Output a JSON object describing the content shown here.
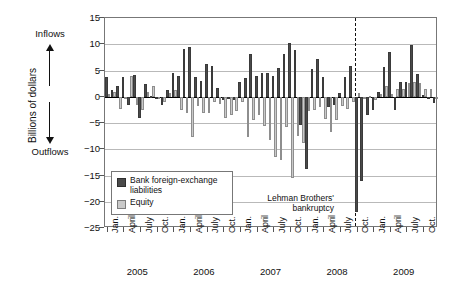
{
  "axis": {
    "y_title": "Billions of dollars",
    "y_ticks": [
      "15",
      "10",
      "5",
      "0",
      "-5",
      "-10",
      "-15",
      "-20",
      "-25"
    ],
    "quarter_labels": [
      "Jan.",
      "April",
      "July",
      "Oct."
    ],
    "year_labels": [
      "2005",
      "2006",
      "2007",
      "2008",
      "2009"
    ]
  },
  "annotations": {
    "inflows": "Inflows",
    "outflows": "Outflows",
    "event_line1": "Lehman Brothers'",
    "event_line2": "bankruptcy"
  },
  "legend": {
    "items": [
      {
        "label": "Bank foreign-exchange liabilities",
        "color": "#4a4a4a",
        "swatch": "dark"
      },
      {
        "label": "Equity",
        "color": "#c9c9c9",
        "swatch": "light"
      }
    ]
  },
  "chart_data": {
    "type": "bar",
    "title": "",
    "xlabel": "",
    "ylabel": "Billions of dollars",
    "ylim": [
      -25,
      15
    ],
    "ytick_step": 5,
    "grid": true,
    "legend_position": "inside-lower-left",
    "x": [
      "2005-01",
      "2005-02",
      "2005-03",
      "2005-04",
      "2005-05",
      "2005-06",
      "2005-07",
      "2005-08",
      "2005-09",
      "2005-10",
      "2005-11",
      "2005-12",
      "2006-01",
      "2006-02",
      "2006-03",
      "2006-04",
      "2006-05",
      "2006-06",
      "2006-07",
      "2006-08",
      "2006-09",
      "2006-10",
      "2006-11",
      "2006-12",
      "2007-01",
      "2007-02",
      "2007-03",
      "2007-04",
      "2007-05",
      "2007-06",
      "2007-07",
      "2007-08",
      "2007-09",
      "2007-10",
      "2007-11",
      "2007-12",
      "2008-01",
      "2008-02",
      "2008-03",
      "2008-04",
      "2008-05",
      "2008-06",
      "2008-07",
      "2008-08",
      "2008-09",
      "2008-10",
      "2008-11",
      "2008-12",
      "2009-01",
      "2009-02",
      "2009-03",
      "2009-04",
      "2009-05",
      "2009-06",
      "2009-07",
      "2009-08",
      "2009-09",
      "2009-10",
      "2009-11",
      "2009-12"
    ],
    "categories": [
      "Jan. 2005",
      "Feb. 2005",
      "Mar. 2005",
      "April 2005",
      "May 2005",
      "June 2005",
      "July 2005",
      "Aug. 2005",
      "Sept. 2005",
      "Oct. 2005",
      "Nov. 2005",
      "Dec. 2005",
      "Jan. 2006",
      "Feb. 2006",
      "Mar. 2006",
      "April 2006",
      "May 2006",
      "June 2006",
      "July 2006",
      "Aug. 2006",
      "Sept. 2006",
      "Oct. 2006",
      "Nov. 2006",
      "Dec. 2006",
      "Jan. 2007",
      "Feb. 2007",
      "Mar. 2007",
      "April 2007",
      "May 2007",
      "June 2007",
      "July 2007",
      "Aug. 2007",
      "Sept. 2007",
      "Oct. 2007",
      "Nov. 2007",
      "Dec. 2007",
      "Jan. 2008",
      "Feb. 2008",
      "Mar. 2008",
      "April 2008",
      "May 2008",
      "June 2008",
      "July 2008",
      "Aug. 2008",
      "Sept. 2008",
      "Oct. 2008",
      "Nov. 2008",
      "Dec. 2008",
      "Jan. 2009",
      "Feb. 2009",
      "Mar. 2009",
      "April 2009",
      "May 2009",
      "June 2009",
      "July 2009",
      "Aug. 2009",
      "Sept. 2009",
      "Oct. 2009",
      "Nov. 2009",
      "Dec. 2009"
    ],
    "series": [
      {
        "name": "Bank foreign-exchange liabilities",
        "color": "#4a4a4a",
        "values": [
          3.7,
          1.3,
          2.0,
          3.8,
          -1.6,
          4.1,
          -4.0,
          2.5,
          0.2,
          -0.4,
          -1.6,
          1.2,
          4.6,
          4.0,
          9.1,
          9.4,
          3.7,
          3.0,
          6.3,
          5.8,
          1.7,
          -0.6,
          -0.5,
          -0.7,
          2.9,
          3.6,
          8.2,
          4.0,
          4.6,
          4.5,
          3.9,
          5.4,
          8.2,
          10.3,
          9.0,
          -5.4,
          -13.8,
          5.3,
          7.2,
          3.8,
          -2.0,
          -1.5,
          0.7,
          3.8,
          5.8,
          -22.0,
          -16.0,
          -3.5,
          -2.5,
          1.0,
          5.7,
          8.5,
          -2.5,
          2.8,
          2.9,
          9.8,
          4.3,
          0.4,
          -0.3,
          -1.2
        ]
      },
      {
        "name": "Equity",
        "color": "#c9c9c9",
        "values": [
          0.5,
          0.9,
          -2.3,
          -0.3,
          4.0,
          -1.5,
          -2.5,
          0.9,
          2.0,
          -0.3,
          -1.0,
          0.7,
          1.3,
          -2.5,
          -3.0,
          -7.7,
          -1.8,
          -3.1,
          -3.0,
          -1.0,
          -1.4,
          -4.0,
          -3.4,
          -2.7,
          -1.0,
          -7.6,
          -4.4,
          -3.5,
          -5.5,
          -8.3,
          -11.5,
          -12.1,
          -5.7,
          -15.4,
          -7.4,
          -8.9,
          -2.7,
          -2.5,
          -2.0,
          -4.2,
          -6.7,
          -4.5,
          -1.7,
          -2.4,
          -1.0,
          0.7,
          -0.2,
          0.2,
          -0.6,
          0.6,
          2.0,
          0.6,
          1.4,
          1.4,
          2.6,
          2.9,
          2.6,
          1.4,
          1.5,
          -0.1
        ]
      }
    ],
    "event_marker": {
      "label": "Lehman Brothers' bankruptcy",
      "at": "2008-09"
    }
  }
}
